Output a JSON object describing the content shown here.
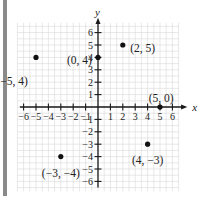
{
  "chart_data": {
    "type": "scatter",
    "title": "",
    "xlabel": "x",
    "ylabel": "y",
    "xlim": [
      -6,
      6
    ],
    "ylim": [
      -6,
      6
    ],
    "grid": true,
    "x_ticks": [
      -6,
      -5,
      -4,
      -3,
      -2,
      -1,
      1,
      2,
      3,
      4,
      5,
      6
    ],
    "y_ticks": [
      -6,
      -5,
      -4,
      -3,
      -2,
      -1,
      1,
      2,
      3,
      4,
      5,
      6
    ],
    "x_tick_labels": [
      "-6",
      "-5",
      "-4",
      "-3",
      "-2",
      "-1",
      "1",
      "2",
      "3",
      "4",
      "5",
      "6"
    ],
    "y_tick_labels": [
      "-6",
      "-5",
      "-4",
      "-3",
      "-2",
      "-1",
      "1",
      "2",
      "3",
      "4",
      "5",
      "6"
    ],
    "points": [
      {
        "x": -5,
        "y": 4,
        "label": "(−5, 4)",
        "lx": -8.2,
        "ly": 2.1,
        "anchor": "start"
      },
      {
        "x": 0,
        "y": 4,
        "label": "(0, 4)",
        "lx": -0.5,
        "ly": 3.8,
        "anchor": "end"
      },
      {
        "x": 2,
        "y": 5,
        "label": "(2, 5)",
        "lx": 2.6,
        "ly": 4.75,
        "anchor": "start"
      },
      {
        "x": 5,
        "y": 0,
        "label": "(5, 0)",
        "lx": 5.1,
        "ly": 0.75,
        "anchor": "middle"
      },
      {
        "x": -3,
        "y": -4,
        "label": "(−3, −4)",
        "lx": -3.0,
        "ly": -5.3,
        "anchor": "middle"
      },
      {
        "x": 4,
        "y": -3,
        "label": "(4, −3)",
        "lx": 4.0,
        "ly": -4.3,
        "anchor": "middle"
      }
    ]
  },
  "colors": {
    "axis": "#1a1a1a",
    "grid": "#d9d9d9",
    "point": "#111111",
    "left_bar": "#8a8a8a"
  }
}
